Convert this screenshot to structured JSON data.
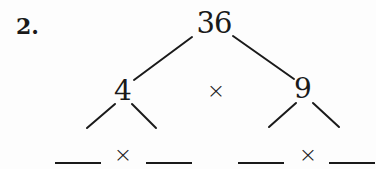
{
  "problem": {
    "number_label": "2.",
    "operator_symbol": "×",
    "root": {
      "value": "36"
    },
    "factors": [
      {
        "value": "4",
        "children": [
          {
            "value": ""
          },
          {
            "value": ""
          }
        ],
        "operator_symbol": "×"
      },
      {
        "value": "9",
        "children": [
          {
            "value": ""
          },
          {
            "value": ""
          }
        ],
        "operator_symbol": "×"
      }
    ]
  }
}
